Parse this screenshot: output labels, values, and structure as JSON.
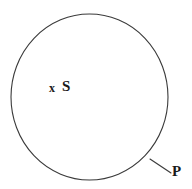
{
  "figure": {
    "type": "set-diagram",
    "background_color": "#ffffff",
    "stroke_color": "#3a3a3a",
    "text_color": "#1a1a1a",
    "width": 192,
    "height": 189
  },
  "shapes": {
    "set_boundary": {
      "name": "circle",
      "center_x": 89.5,
      "center_y": 97,
      "radius_x": 78.5,
      "radius_y": 83,
      "stroke_width": 1.1,
      "fill": "none"
    },
    "pointer_line": {
      "name": "leader-line",
      "x1": 150,
      "y1": 159,
      "x2": 171,
      "y2": 173,
      "stroke_width": 1.1
    }
  },
  "labels": {
    "element_marker": "x",
    "set_name": "S",
    "point_name": "P"
  }
}
